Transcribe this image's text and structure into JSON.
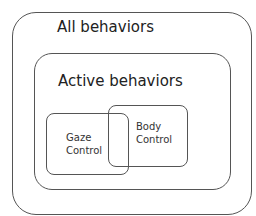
{
  "diagram": {
    "outer": {
      "label": "All behaviors"
    },
    "inner": {
      "label": "Active behaviors"
    },
    "sets": [
      {
        "line1": "Gaze",
        "line2": "Control"
      },
      {
        "line1": "Body",
        "line2": "Control"
      }
    ]
  }
}
